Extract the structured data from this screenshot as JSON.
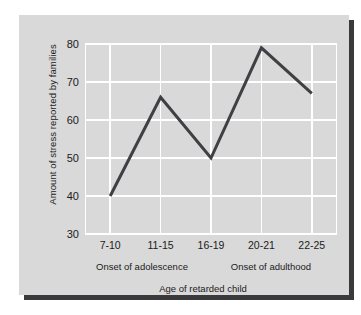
{
  "chart_data": {
    "type": "line",
    "title": "",
    "xlabel": "Age of retarded child",
    "ylabel": "Amount of stress reported by families",
    "categories": [
      "7-10",
      "11-15",
      "16-19",
      "20-21",
      "22-25"
    ],
    "values": [
      40,
      66,
      50,
      79,
      67
    ],
    "series": [
      {
        "name": "Amount of stress reported by families",
        "values": [
          40,
          66,
          50,
          79,
          67
        ]
      }
    ],
    "ylim": [
      30,
      80
    ],
    "yticks": [
      30,
      40,
      50,
      60,
      70,
      80
    ],
    "ytick_labels": [
      "30",
      "40",
      "50",
      "60",
      "70",
      "80"
    ],
    "grid": true,
    "grid_color": "#ffffff",
    "legend": "none",
    "line_color": "#3f3f44",
    "line_width": 3,
    "plot_background": "#d9d9d9",
    "annotations": [
      {
        "text": "Onset of adolescence",
        "position_fraction": 0.31
      },
      {
        "text": "Onset of adulthood",
        "position_fraction": 0.74
      }
    ]
  },
  "figure": {
    "background": "#ffffff",
    "card_background": "#d9d9d9",
    "shadow_color": "#3a3a3c"
  }
}
